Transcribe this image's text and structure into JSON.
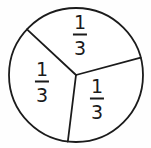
{
  "figure": {
    "name": "circle-divided-into-thirds",
    "background_color": "#fefefe",
    "stroke_color": "#1b1b1b",
    "text_color": "#1b1b1b"
  },
  "chart_data": {
    "type": "pie",
    "title": "",
    "subtitle": "",
    "xlabel": "",
    "ylabel": "",
    "legend": [],
    "grid": false,
    "categories": [
      "sector-top",
      "sector-left",
      "sector-bottom-right"
    ],
    "values": [
      1,
      1,
      1
    ],
    "fractions": [
      "1/3",
      "1/3",
      "1/3"
    ],
    "slice_labels": [
      "1/3",
      "1/3",
      "1/3"
    ],
    "slice_numerators": [
      "1",
      "1",
      "1"
    ],
    "slice_denominators": [
      "3",
      "3",
      "3"
    ],
    "slice_boundary_angles_deg": [
      -15,
      97,
      223
    ],
    "center": {
      "x": 76,
      "y": 75
    },
    "radius": 67,
    "fill_color": "#ffffff",
    "stroke_color": "#1b1b1b",
    "stroke_width": 1.8
  },
  "labels": {
    "top": {
      "numerator": "1",
      "denominator": "3",
      "value": "1/3"
    },
    "left": {
      "numerator": "1",
      "denominator": "3",
      "value": "1/3"
    },
    "bottom_right": {
      "numerator": "1",
      "denominator": "3",
      "value": "1/3"
    }
  }
}
